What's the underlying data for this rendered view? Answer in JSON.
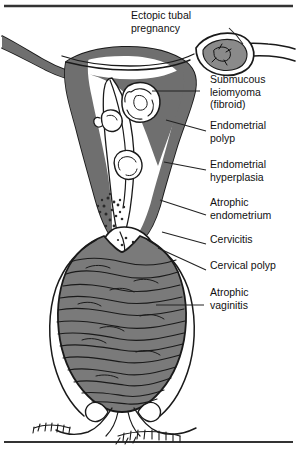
{
  "figure": {
    "frame": {
      "top_rule": "top-horizontal-rule",
      "bottom_rule": "bottom-horizontal-rule",
      "rule_color": "#333333"
    },
    "colors": {
      "outline": "#1a1a1a",
      "tissue_fill": "#6f6f6f",
      "vagina_fill": "#7a7a7a",
      "cavity_fill": "#ffffff",
      "background": "#ffffff",
      "leader_line": "#222222",
      "text": "#111111"
    }
  },
  "labels": [
    {
      "id": "ectopic-tubal-pregnancy",
      "lines": [
        "Ectopic tubal",
        "pregnancy"
      ],
      "x": 131,
      "y": 19,
      "anchor": "start"
    },
    {
      "id": "submucous-leiomyoma",
      "lines": [
        "Submucous",
        "leiomyoma",
        "(fibroid)"
      ],
      "x": 210,
      "y": 83,
      "anchor": "start"
    },
    {
      "id": "endometrial-polyp",
      "lines": [
        "Endometrial",
        "polyp"
      ],
      "x": 210,
      "y": 129,
      "anchor": "start"
    },
    {
      "id": "endometrial-hyperplasia",
      "lines": [
        "Endometrial",
        "hyperplasia"
      ],
      "x": 210,
      "y": 168,
      "anchor": "start"
    },
    {
      "id": "atrophic-endometrium",
      "lines": [
        "Atrophic",
        "endometrium"
      ],
      "x": 210,
      "y": 206,
      "anchor": "start"
    },
    {
      "id": "cervicitis",
      "lines": [
        "Cervicitis"
      ],
      "x": 210,
      "y": 243,
      "anchor": "start"
    },
    {
      "id": "cervical-polyp",
      "lines": [
        "Cervical polyp"
      ],
      "x": 210,
      "y": 269,
      "anchor": "start"
    },
    {
      "id": "atrophic-vaginitis",
      "lines": [
        "Atrophic",
        "vaginitis"
      ],
      "x": 210,
      "y": 296,
      "anchor": "start"
    }
  ],
  "leaders": [
    {
      "id": "leader-ectopic-tubal-pregnancy",
      "d": "M229 28 L237 36 L243 44"
    },
    {
      "id": "leader-submucous-leiomyoma",
      "d": "M200 91 L152 91"
    },
    {
      "id": "leader-endometrial-polyp",
      "d": "M206 131 L166 120"
    },
    {
      "id": "leader-endometrial-hyperplasia",
      "d": "M206 170 L164 162"
    },
    {
      "id": "leader-atrophic-endometrium",
      "d": "M206 215 L160 200"
    },
    {
      "id": "leader-cervicitis",
      "d": "M206 244 L162 232"
    },
    {
      "id": "leader-cervical-polyp",
      "d": "M206 270 L158 248"
    },
    {
      "id": "leader-atrophic-vaginitis",
      "d": "M204 305 L156 305"
    }
  ],
  "anatomy": {
    "parts": [
      "left-fallopian-tube",
      "right-fallopian-tube",
      "left-ovary",
      "right-ovary",
      "uterine-fundus",
      "uterine-wall",
      "endometrial-cavity",
      "cervix",
      "vaginal-canal",
      "vaginal-rugae",
      "labia",
      "pubic-hair"
    ],
    "lesions": [
      "ectopic-pregnancy-mass",
      "submucous-fibroid-mass",
      "endometrial-polyp-mass",
      "endometrial-hyperplasia-zone",
      "atrophic-endometrium-zone",
      "cervicitis-zone",
      "cervical-polyp-mass"
    ]
  }
}
